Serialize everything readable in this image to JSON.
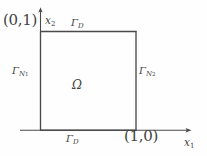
{
  "figure": {
    "type": "domain-diagram",
    "background_color": "#fefefe",
    "line_color": "#4a4a4a",
    "text_color": "#434343"
  },
  "labels": {
    "corner_top_left": "(0,1)",
    "corner_bottom_right": "(1,0)",
    "axis_vertical": "x",
    "axis_vertical_sub": "2",
    "axis_horizontal": "x",
    "axis_horizontal_sub": "1",
    "boundary_top": "Γ",
    "boundary_top_sub": "D",
    "boundary_bottom": "Γ",
    "boundary_bottom_sub": "D",
    "boundary_left": "Γ",
    "boundary_left_sub": "N",
    "boundary_left_subsub": "1",
    "boundary_right": "Γ",
    "boundary_right_sub": "N",
    "boundary_right_subsub": "2",
    "domain_symbol": "Ω"
  },
  "geometry": {
    "square_left": 40,
    "square_top": 31,
    "square_right": 136,
    "square_bottom": 130,
    "axis_x_end": 191,
    "axis_y_top": 8
  }
}
